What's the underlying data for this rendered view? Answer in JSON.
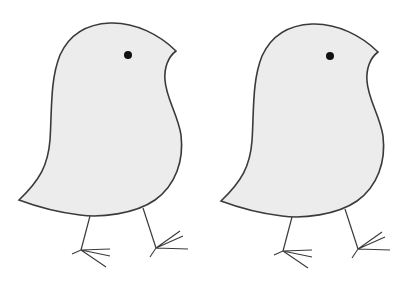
{
  "image": {
    "description": "Two nearly identical line-drawn birds (chicks) side by side",
    "background_color": "#ffffff",
    "body_fill_color": "#ececec",
    "outline_color": "#3a3a3a",
    "eye_color": "#111111"
  },
  "birds": [
    {
      "name": "left-bird",
      "offset_x": 0
    },
    {
      "name": "right-bird",
      "offset_x": 202
    }
  ]
}
